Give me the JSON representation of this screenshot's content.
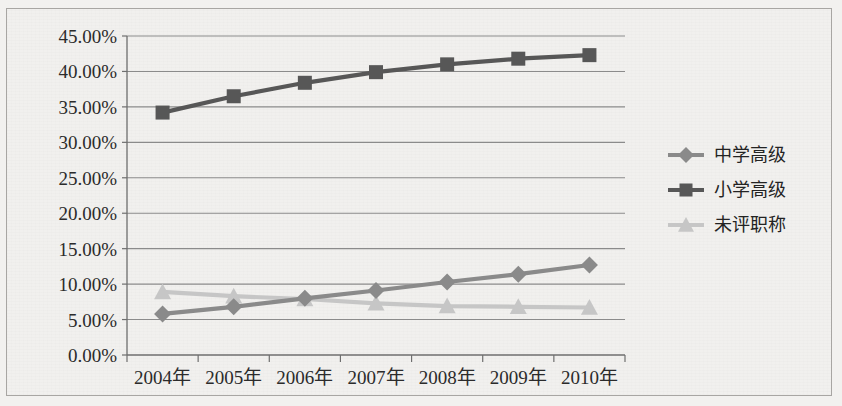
{
  "chart_data": {
    "type": "line",
    "title": "",
    "xlabel": "",
    "ylabel": "",
    "categories": [
      "2004年",
      "2005年",
      "2006年",
      "2007年",
      "2008年",
      "2009年",
      "2010年"
    ],
    "ylim": [
      0,
      45
    ],
    "ytick_labels": [
      "0.00%",
      "5.00%",
      "10.00%",
      "15.00%",
      "20.00%",
      "25.00%",
      "30.00%",
      "35.00%",
      "40.00%",
      "45.00%"
    ],
    "ytick_values": [
      0,
      5,
      10,
      15,
      20,
      25,
      30,
      35,
      40,
      45
    ],
    "grid": true,
    "legend_position": "right",
    "series": [
      {
        "name": "中学高级",
        "marker": "diamond",
        "color": "#8a8a8a",
        "values": [
          5.8,
          6.8,
          8.0,
          9.1,
          10.3,
          11.4,
          12.7
        ],
        "value_labels": [
          "5.80%",
          "6.80%",
          "8.00%",
          "9.10%",
          "10.30%",
          "11.40%",
          "12.70%"
        ]
      },
      {
        "name": "小学高级",
        "marker": "square",
        "color": "#575757",
        "values": [
          34.2,
          36.5,
          38.4,
          39.9,
          41.0,
          41.8,
          42.3
        ],
        "value_labels": [
          "34.20%",
          "36.50%",
          "38.40%",
          "39.90%",
          "41.00%",
          "41.80%",
          "42.30%"
        ]
      },
      {
        "name": "未评职称",
        "marker": "triangle",
        "color": "#c6c6c6",
        "values": [
          8.9,
          8.3,
          7.9,
          7.3,
          6.9,
          6.8,
          6.7
        ],
        "value_labels": [
          "8.90%",
          "8.30%",
          "7.90%",
          "7.30%",
          "6.90%",
          "6.80%",
          "6.70%"
        ]
      }
    ]
  },
  "legend": {
    "items": [
      {
        "label": "中学高级",
        "marker": "diamond-marker-icon"
      },
      {
        "label": "小学高级",
        "marker": "square-marker-icon"
      },
      {
        "label": "未评职称",
        "marker": "triangle-marker-icon"
      }
    ]
  },
  "colors": {
    "background": "#f1f0ee",
    "border": "#a8a6a3",
    "grid": "#8b8b8b",
    "axis": "#6f6f6f",
    "series_1": "#8a8a8a",
    "series_2": "#575757",
    "series_3": "#c6c6c6",
    "text": "#2b2b2b"
  }
}
